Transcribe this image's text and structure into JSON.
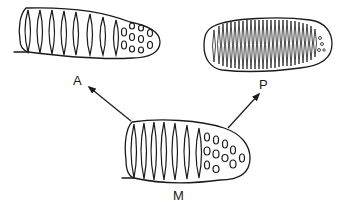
{
  "diagram": {
    "labels": {
      "anterior": "A",
      "posterior": "P",
      "middle": "M"
    },
    "shapes": [
      {
        "id": "A",
        "description": "elongated segmented form, elongate stripes left, dotted right tip"
      },
      {
        "id": "P",
        "description": "oval form densely packed with fine stripes"
      },
      {
        "id": "M",
        "description": "central form with stripes left and dots at right tip"
      }
    ],
    "arrows": [
      {
        "from": "M",
        "to": "A"
      },
      {
        "from": "M",
        "to": "P"
      }
    ],
    "colors": {
      "ink": "#1a1a1a",
      "background": "#ffffff"
    }
  }
}
